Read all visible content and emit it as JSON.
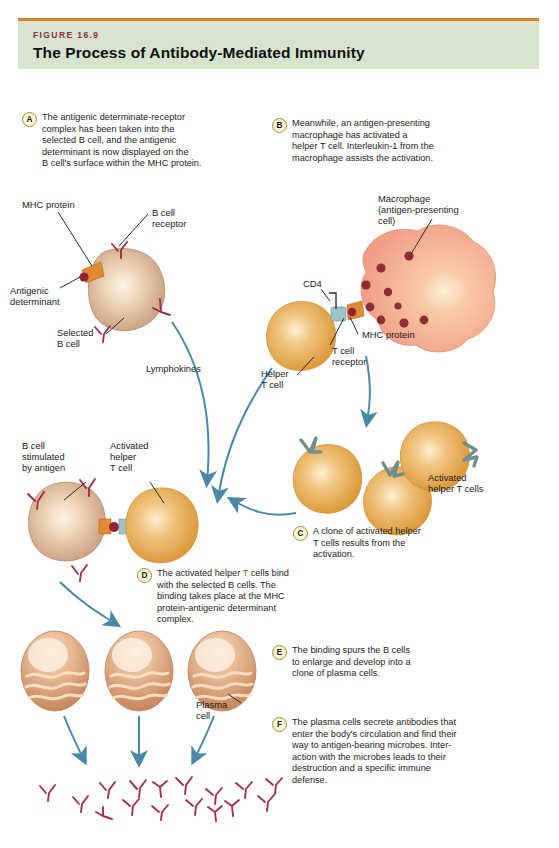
{
  "header": {
    "figure_number": "FIGURE 16.9",
    "title": "The Process of Antibody-Mediated Immunity",
    "rule_color": "#d98028",
    "band_color": "#d6e3cd",
    "figure_number_color": "#8d2f3e"
  },
  "steps": [
    {
      "id": "A",
      "text": "The antigenic determinate-receptor\ncomplex has been taken into the\nselected B cell, and the antigenic\ndeterminant is now displayed on the\nB cell's surface within the MHC protein."
    },
    {
      "id": "B",
      "text": "Meanwhile, an antigen-presenting\nmacrophage has activated a\nhelper T cell. Interleukin-1 from the\nmacrophage assists the activation."
    },
    {
      "id": "C",
      "text": "A clone of activated helper\nT cells results from the\nactivation."
    },
    {
      "id": "D",
      "text_part1": "The activated helper ",
      "text_highlight": "T",
      "text_part2": " cells bind\nwith the selected B cells. The\nbinding takes place at the MHC\nprotein-antigenic determinant\ncomplex."
    },
    {
      "id": "E",
      "text": "The binding spurs the B cells\nto enlarge and develop into a\nclone of plasma cells."
    },
    {
      "id": "F",
      "text": "The plasma cells secrete antibodies that\nenter the body's circulation and find their\nway to antigen-bearing microbes. Inter-\naction with the microbes leads to their\ndestruction and a specific immune\ndefense."
    }
  ],
  "labels": {
    "mhc_protein_top": "MHC protein",
    "b_cell_receptor": "B cell\nreceptor",
    "antigenic_determinant": "Antigenic\ndeterminant",
    "selected_b_cell": "Selected\nB cell",
    "lymphokines": "Lymphokines",
    "macrophage": "Macrophage\n(antigen-presenting\ncell)",
    "cd4": "CD4",
    "mhc_protein_right": "MHC protein",
    "t_cell_receptor": "T cell\nreceptor",
    "helper_t_cell": "Helper\nT cell",
    "activated_helper_t_cells": "Activated\nhelper T cells",
    "b_cell_stimulated": "B cell\nstimulated\nby antigen",
    "activated_helper_t_cell": "Activated\nhelper\nT cell",
    "plasma_cell": "Plasma\ncell"
  },
  "colors": {
    "b_cell_fill": "#c9a183",
    "b_cell_highlight": "#f7eadd",
    "t_cell_fill": "#e0a14f",
    "t_cell_highlight": "#fbe9c4",
    "macrophage_fill": "#f4a68f",
    "macrophage_highlight": "#fbe3c9",
    "granule": "#8f2f33",
    "antibody": "#a32f46",
    "arrow": "#4a87a8",
    "mhc_orange": "#e08a33",
    "cd4_teal": "#9dc3c6",
    "t_receptor_teal": "#6f8f8c",
    "plasma_fill": "#cf9c7e",
    "plasma_band": "#f5d9b8"
  }
}
